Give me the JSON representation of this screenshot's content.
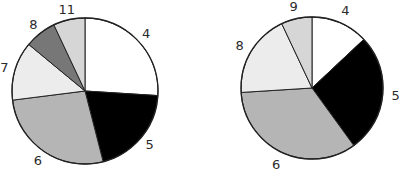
{
  "chart_data": [
    {
      "type": "pie",
      "title": "",
      "start": "top",
      "direction": "clockwise",
      "slices": [
        {
          "label": "4",
          "value": 26,
          "color": "#ffffff"
        },
        {
          "label": "5",
          "value": 20,
          "color": "#000000"
        },
        {
          "label": "6",
          "value": 27,
          "color": "#b5b5b5"
        },
        {
          "label": "7",
          "value": 13,
          "color": "#ececec"
        },
        {
          "label": "8",
          "value": 7,
          "color": "#777777"
        },
        {
          "label": "11",
          "value": 7,
          "color": "#d6d6d6"
        }
      ]
    },
    {
      "type": "pie",
      "title": "",
      "start": "top",
      "direction": "clockwise",
      "slices": [
        {
          "label": "4",
          "value": 13,
          "color": "#ffffff"
        },
        {
          "label": "5",
          "value": 27,
          "color": "#000000"
        },
        {
          "label": "6",
          "value": 34,
          "color": "#b5b5b5"
        },
        {
          "label": "8",
          "value": 19,
          "color": "#ececec"
        },
        {
          "label": "9",
          "value": 7,
          "color": "#d6d6d6"
        }
      ]
    }
  ]
}
